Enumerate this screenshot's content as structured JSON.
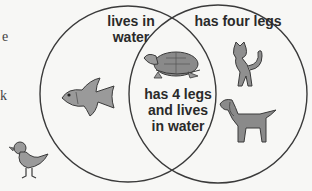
{
  "diagram": {
    "type": "venn",
    "sets": [
      {
        "id": "left",
        "label_line1": "lives in",
        "label_line2": "water"
      },
      {
        "id": "right",
        "label": "has four legs"
      }
    ],
    "intersection": {
      "line1": "has 4 legs",
      "line2": "and lives",
      "line3": "in water"
    },
    "members": {
      "left_only": [
        "goldfish"
      ],
      "right_only": [
        "cat",
        "dog"
      ],
      "intersection": [
        "turtle"
      ],
      "outside": [
        "chick"
      ]
    },
    "cropped_text_fragments": [
      "e",
      "k"
    ],
    "colors": {
      "line": "#3a3a3a",
      "animal_fill": "#8c8c8c",
      "background": "#f7f7f5"
    }
  }
}
